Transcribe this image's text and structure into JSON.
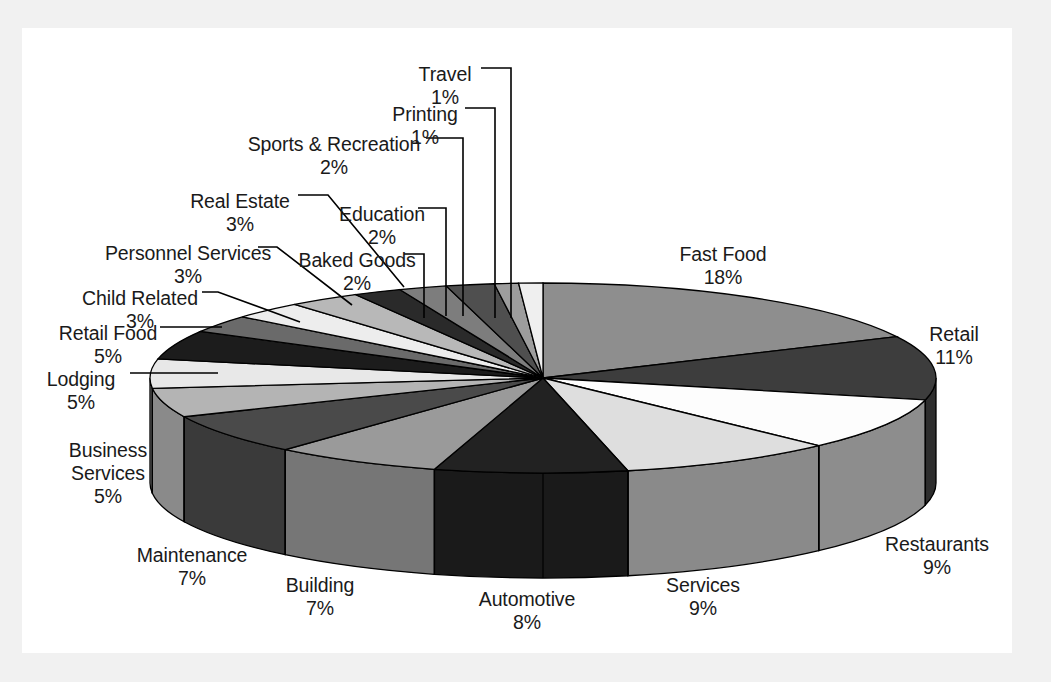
{
  "chart_data": {
    "type": "pie",
    "title": "",
    "legend_position": "callout-labels",
    "three_d": true,
    "start_angle_deg": 0,
    "direction": "clockwise",
    "grid": false,
    "units": "percent",
    "total": 100,
    "categories": [
      "Fast Food",
      "Retail",
      "Restaurants",
      "Services",
      "Automotive",
      "Building",
      "Maintenance",
      "Business Services",
      "Lodging",
      "Retail Food",
      "Child Related",
      "Personnel Services",
      "Real Estate",
      "Baked Goods",
      "Education",
      "Sports & Recreation",
      "Printing",
      "Travel"
    ],
    "values": [
      18,
      11,
      9,
      9,
      8,
      7,
      7,
      5,
      5,
      5,
      3,
      3,
      3,
      2,
      2,
      2,
      1,
      1
    ],
    "slices": [
      {
        "label": "Fast Food",
        "pct": 18,
        "pct_text": "18%",
        "fill": "#8e8e8e",
        "side": "#6f6f6f"
      },
      {
        "label": "Retail",
        "pct": 11,
        "pct_text": "11%",
        "fill": "#3d3d3d",
        "side": "#2e2e2e"
      },
      {
        "label": "Restaurants",
        "pct": 9,
        "pct_text": "9%",
        "fill": "#fdfdfd",
        "side": "#8d8d8d"
      },
      {
        "label": "Services",
        "pct": 9,
        "pct_text": "9%",
        "fill": "#dedede",
        "side": "#8a8a8a"
      },
      {
        "label": "Automotive",
        "pct": 8,
        "pct_text": "8%",
        "fill": "#222222",
        "side": "#1a1a1a"
      },
      {
        "label": "Building",
        "pct": 7,
        "pct_text": "7%",
        "fill": "#9a9a9a",
        "side": "#767676"
      },
      {
        "label": "Maintenance",
        "pct": 7,
        "pct_text": "7%",
        "fill": "#4a4a4a",
        "side": "#3a3a3a"
      },
      {
        "label": "Business Services",
        "pct": 5,
        "pct_text": "5%",
        "fill": "#b4b4b4",
        "side": "#8a8a8a"
      },
      {
        "label": "Lodging",
        "pct": 5,
        "pct_text": "5%",
        "fill": "#e8e8e8",
        "side": "#9c9c9c"
      },
      {
        "label": "Retail Food",
        "pct": 5,
        "pct_text": "5%",
        "fill": "#1c1c1c",
        "side": "#141414"
      },
      {
        "label": "Child Related",
        "pct": 3,
        "pct_text": "3%",
        "fill": "#6a6a6a",
        "side": "#545454"
      },
      {
        "label": "Personnel Services",
        "pct": 3,
        "pct_text": "3%",
        "fill": "#ededed",
        "side": "#a0a0a0"
      },
      {
        "label": "Real Estate",
        "pct": 3,
        "pct_text": "3%",
        "fill": "#b8b8b8",
        "side": "#8e8e8e"
      },
      {
        "label": "Baked Goods",
        "pct": 2,
        "pct_text": "2%",
        "fill": "#2a2a2a",
        "side": "#202020"
      },
      {
        "label": "Education",
        "pct": 2,
        "pct_text": "2%",
        "fill": "#7d7d7d",
        "side": "#616161"
      },
      {
        "label": "Sports & Recreation",
        "pct": 2,
        "pct_text": "2%",
        "fill": "#4f4f4f",
        "side": "#3e3e3e"
      },
      {
        "label": "Printing",
        "pct": 1,
        "pct_text": "1%",
        "fill": "#9d9d9d",
        "side": "#7a7a7a"
      },
      {
        "label": "Travel",
        "pct": 1,
        "pct_text": "1%",
        "fill": "#efefef",
        "side": "#a8a8a8"
      }
    ]
  },
  "labels": {
    "fast_food": {
      "name": "Fast Food",
      "pct": "18%"
    },
    "retail": {
      "name": "Retail",
      "pct": "11%"
    },
    "restaurants": {
      "name": "Restaurants",
      "pct": "9%"
    },
    "services": {
      "name": "Services",
      "pct": "9%"
    },
    "automotive": {
      "name": "Automotive",
      "pct": "8%"
    },
    "building": {
      "name": "Building",
      "pct": "7%"
    },
    "maintenance": {
      "name": "Maintenance",
      "pct": "7%"
    },
    "business_services": {
      "name_line1": "Business",
      "name_line2": "Services",
      "pct": "5%"
    },
    "lodging": {
      "name": "Lodging",
      "pct": "5%"
    },
    "retail_food": {
      "name": "Retail Food",
      "pct": "5%"
    },
    "child_related": {
      "name": "Child Related",
      "pct": "3%"
    },
    "personnel_services": {
      "name": "Personnel Services",
      "pct": "3%"
    },
    "real_estate": {
      "name": "Real Estate",
      "pct": "3%"
    },
    "baked_goods": {
      "name": "Baked Goods",
      "pct": "2%"
    },
    "education": {
      "name": "Education",
      "pct": "2%"
    },
    "sports_recreation": {
      "name": "Sports & Recreation",
      "pct": "2%"
    },
    "printing": {
      "name": "Printing",
      "pct": "1%"
    },
    "travel": {
      "name": "Travel",
      "pct": "1%"
    }
  },
  "colors": {
    "page_background": "#f1f1f1",
    "chart_background": "#ffffff",
    "outline": "#000000",
    "text": "#1a1a1a"
  }
}
